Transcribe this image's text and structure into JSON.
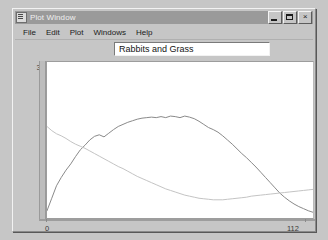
{
  "window": {
    "title": "Plot Window",
    "icon": "plot-window-icon",
    "controls": {
      "minimize": "_",
      "maximize": "□",
      "close": "×"
    }
  },
  "menu": {
    "items": [
      {
        "label": "File"
      },
      {
        "label": "Edit"
      },
      {
        "label": "Plot"
      },
      {
        "label": "Windows"
      },
      {
        "label": "Help"
      }
    ]
  },
  "title_field": {
    "value": "Rabbits and Grass",
    "placeholder": "Rabbits and Grass"
  },
  "chart_data": {
    "type": "line",
    "title": "Rabbits and Grass",
    "xlabel": "",
    "ylabel": "",
    "xlim": [
      0,
      112
    ],
    "ylim": [
      0,
      300
    ],
    "xticks": [
      "0",
      "112"
    ],
    "yticks": [
      "0",
      "300"
    ],
    "grid": false,
    "legend": "none",
    "x": [
      0,
      2,
      4,
      6,
      8,
      10,
      12,
      14,
      16,
      18,
      20,
      22,
      24,
      26,
      28,
      30,
      32,
      34,
      36,
      38,
      40,
      42,
      44,
      46,
      48,
      50,
      52,
      54,
      56,
      58,
      60,
      62,
      64,
      66,
      68,
      70,
      72,
      74,
      76,
      78,
      80,
      82,
      84,
      86,
      88,
      90,
      92,
      94,
      96,
      98,
      100,
      102,
      104,
      106,
      108,
      110,
      112
    ],
    "series": [
      {
        "name": "Rabbits",
        "color": "#8a8a8a",
        "values": [
          14,
          38,
          62,
          78,
          92,
          104,
          118,
          131,
          140,
          150,
          157,
          160,
          156,
          163,
          170,
          176,
          180,
          184,
          187,
          190,
          192,
          193,
          194,
          193,
          195,
          193,
          196,
          195,
          193,
          196,
          194,
          191,
          186,
          180,
          174,
          170,
          165,
          158,
          150,
          142,
          133,
          124,
          116,
          107,
          98,
          88,
          78,
          68,
          58,
          48,
          40,
          33,
          27,
          22,
          18,
          14,
          11
        ]
      },
      {
        "name": "Grass",
        "color": "#c4c4c4",
        "values": [
          176,
          168,
          162,
          158,
          153,
          147,
          142,
          138,
          134,
          129,
          124,
          119,
          114,
          109,
          104,
          99,
          95,
          90,
          85,
          80,
          76,
          72,
          68,
          64,
          60,
          56,
          53,
          50,
          47,
          44,
          42,
          40,
          38,
          37,
          36,
          35,
          35,
          35,
          36,
          37,
          38,
          39,
          40,
          42,
          43,
          44,
          45,
          46,
          47,
          48,
          49,
          50,
          51,
          52,
          53,
          54,
          55
        ]
      }
    ]
  }
}
